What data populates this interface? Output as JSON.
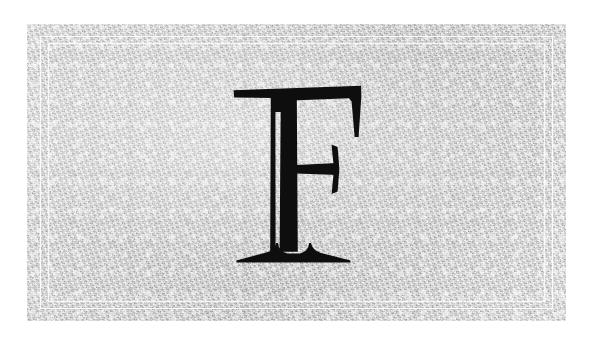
{
  "page": {
    "kind": "monogram-card",
    "background_color": "#ffffff",
    "width": 591,
    "height": 338
  },
  "card": {
    "name": "textured paper card",
    "background_color": "#d9d9d9",
    "texture": "fine speckled paper grain",
    "left": 27,
    "top": 24,
    "width": 539,
    "height": 297
  },
  "border": {
    "style": "double hairline rule",
    "color": "#ffffff",
    "outer_inset": 13,
    "inner_inset": 21,
    "line_width": 1
  },
  "monogram": {
    "letter": "F",
    "label": "capital letter F",
    "color": "#0e0e0e",
    "style": "high-contrast serif with split inline stem and flared bracketed serifs",
    "left": 203,
    "top": 61,
    "width": 134,
    "height": 178
  }
}
